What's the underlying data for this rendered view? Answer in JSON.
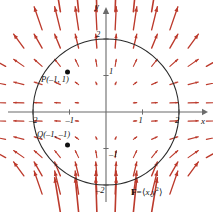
{
  "figure": {
    "kind": "vector-field-plot",
    "formula_text": "F = ⟨x, y²⟩",
    "formula_parts": {
      "field_symbol": "F",
      "equals": "=",
      "open_angle": "⟨",
      "first_component": "x",
      "comma": ",",
      "second_component": "y",
      "second_exponent": "2",
      "close_angle": "⟩"
    },
    "axis_labels": {
      "x": "x",
      "y": "y"
    },
    "x_ticks": [
      {
        "value": -2,
        "label": "–2"
      },
      {
        "value": -1,
        "label": "–1"
      },
      {
        "value": 1,
        "label": "1"
      },
      {
        "value": 2,
        "label": "2"
      }
    ],
    "y_ticks": [
      {
        "value": -2,
        "label": "–2"
      },
      {
        "value": -1,
        "label": "–1"
      },
      {
        "value": 1,
        "label": "1"
      },
      {
        "value": 2,
        "label": "2"
      }
    ],
    "points": [
      {
        "name": "P",
        "label": "P(–1, 1)",
        "x": -1,
        "y": 1
      },
      {
        "name": "Q",
        "label": "Q(–1, –1)",
        "x": -1,
        "y": -1
      }
    ],
    "circle": {
      "center_x": 0,
      "center_y": 0,
      "radius": 2
    },
    "colors": {
      "arrow": "#bc3a2c",
      "axis": "#6b6b6b",
      "circle": "#2b2b2b",
      "point": "#111111",
      "background": "#ffffff"
    }
  },
  "chart_data": {
    "type": "scatter",
    "title": "",
    "subtitle": "",
    "xlabel": "x",
    "ylabel": "y",
    "xlim": [
      -2.9,
      2.9
    ],
    "ylim": [
      -2.9,
      2.9
    ],
    "grid": false,
    "legend_position": "none",
    "vector_field": {
      "expression": "F = <x, y^2>",
      "fx": "x",
      "fy": "y^2",
      "sample_min": -2.75,
      "sample_max": 2.75,
      "sample_step": 0.5,
      "arrow_scale": 0.33,
      "samples": [
        {
          "x": -2.5,
          "y": 2.5,
          "u": -2.5,
          "v": 6.25
        },
        {
          "x": -2.0,
          "y": 2.5,
          "u": -2.0,
          "v": 6.25
        },
        {
          "x": -1.5,
          "y": 2.5,
          "u": -1.5,
          "v": 6.25
        },
        {
          "x": -1.0,
          "y": 2.5,
          "u": -1.0,
          "v": 6.25
        },
        {
          "x": -0.5,
          "y": 2.5,
          "u": -0.5,
          "v": 6.25
        },
        {
          "x": 0.0,
          "y": 2.5,
          "u": 0.0,
          "v": 6.25
        },
        {
          "x": 0.5,
          "y": 2.5,
          "u": 0.5,
          "v": 6.25
        },
        {
          "x": 1.0,
          "y": 2.5,
          "u": 1.0,
          "v": 6.25
        },
        {
          "x": 1.5,
          "y": 2.5,
          "u": 1.5,
          "v": 6.25
        },
        {
          "x": 2.0,
          "y": 2.5,
          "u": 2.0,
          "v": 6.25
        },
        {
          "x": 2.5,
          "y": 2.5,
          "u": 2.5,
          "v": 6.25
        },
        {
          "x": -2.0,
          "y": 1.5,
          "u": -2.0,
          "v": 2.25
        },
        {
          "x": -1.0,
          "y": 1.5,
          "u": -1.0,
          "v": 2.25
        },
        {
          "x": 0.0,
          "y": 1.5,
          "u": 0.0,
          "v": 2.25
        },
        {
          "x": 1.0,
          "y": 1.5,
          "u": 1.0,
          "v": 2.25
        },
        {
          "x": 2.0,
          "y": 1.5,
          "u": 2.0,
          "v": 2.25
        },
        {
          "x": -2.0,
          "y": 0.5,
          "u": -2.0,
          "v": 0.25
        },
        {
          "x": -1.0,
          "y": 0.5,
          "u": -1.0,
          "v": 0.25
        },
        {
          "x": 0.0,
          "y": 0.5,
          "u": 0.0,
          "v": 0.25
        },
        {
          "x": 1.0,
          "y": 0.5,
          "u": 1.0,
          "v": 0.25
        },
        {
          "x": 2.0,
          "y": 0.5,
          "u": 2.0,
          "v": 0.25
        },
        {
          "x": -2.0,
          "y": 0.0,
          "u": -2.0,
          "v": 0.0
        },
        {
          "x": -1.0,
          "y": 0.0,
          "u": -1.0,
          "v": 0.0
        },
        {
          "x": 1.0,
          "y": 0.0,
          "u": 1.0,
          "v": 0.0
        },
        {
          "x": 2.0,
          "y": 0.0,
          "u": 2.0,
          "v": 0.0
        },
        {
          "x": -2.0,
          "y": -1.5,
          "u": -2.0,
          "v": 2.25
        },
        {
          "x": -1.0,
          "y": -1.5,
          "u": -1.0,
          "v": 2.25
        },
        {
          "x": 0.0,
          "y": -1.5,
          "u": 0.0,
          "v": 2.25
        },
        {
          "x": 1.0,
          "y": -1.5,
          "u": 1.0,
          "v": 2.25
        },
        {
          "x": 2.0,
          "y": -1.5,
          "u": 2.0,
          "v": 2.25
        },
        {
          "x": -2.5,
          "y": -2.5,
          "u": -2.5,
          "v": 6.25
        },
        {
          "x": 0.0,
          "y": -2.5,
          "u": 0.0,
          "v": 6.25
        },
        {
          "x": 2.5,
          "y": -2.5,
          "u": 2.5,
          "v": 6.25
        }
      ]
    },
    "annotations": [
      {
        "text": "P(–1, 1)",
        "x": -1,
        "y": 1
      },
      {
        "text": "Q(–1, –1)",
        "x": -1,
        "y": -1
      },
      {
        "text": "F = ⟨x, y²⟩",
        "x": 1.35,
        "y": -2.6
      }
    ],
    "shapes": [
      {
        "type": "circle",
        "cx": 0,
        "cy": 0,
        "r": 2
      }
    ],
    "points": [
      {
        "label": "P",
        "x": -1,
        "y": 1
      },
      {
        "label": "Q",
        "x": -1,
        "y": -1
      }
    ]
  }
}
